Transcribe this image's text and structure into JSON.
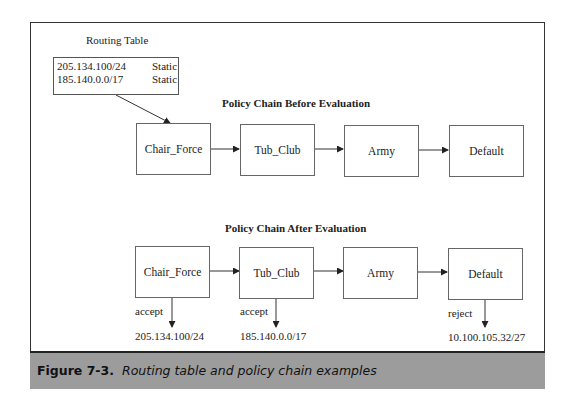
{
  "routing_table": {
    "title": "Routing Table",
    "rows": [
      {
        "prefix": "205.134.100/24",
        "type": "Static"
      },
      {
        "prefix": "185.140.0.0/17",
        "type": "Static"
      }
    ]
  },
  "chain_before": {
    "title": "Policy Chain Before Evaluation",
    "nodes": [
      "Chair_Force",
      "Tub_Club",
      "Army",
      "Default"
    ]
  },
  "chain_after": {
    "title": "Policy Chain After Evaluation",
    "nodes": [
      "Chair_Force",
      "Tub_Club",
      "Army",
      "Default"
    ],
    "outcomes": [
      {
        "node": "Chair_Force",
        "action": "accept",
        "prefix": "205.134.100/24"
      },
      {
        "node": "Tub_Club",
        "action": "accept",
        "prefix": "185.140.0.0/17"
      },
      {
        "node": "Default",
        "action": "reject",
        "prefix": "10.100.105.32/27"
      }
    ]
  },
  "caption": {
    "number": "Figure 7-3.",
    "text": "Routing table and policy chain examples"
  },
  "colors": {
    "caption_bg": "#9c9c9c",
    "border": "#333333"
  }
}
